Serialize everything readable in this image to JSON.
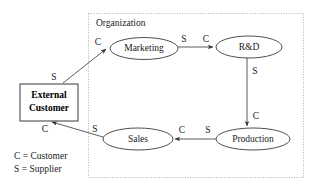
{
  "diagram": {
    "container": {
      "title": "Organization"
    },
    "nodes": [
      {
        "id": "external_customer",
        "label_line1": "External",
        "label_line2": "Customer",
        "shape": "rectangle"
      },
      {
        "id": "marketing",
        "label": "Marketing",
        "shape": "ellipse"
      },
      {
        "id": "rnd",
        "label": "R&D",
        "shape": "ellipse"
      },
      {
        "id": "production",
        "label": "Production",
        "shape": "ellipse"
      },
      {
        "id": "sales",
        "label": "Sales",
        "shape": "ellipse"
      }
    ],
    "edges": [
      {
        "id": "ec-to-marketing",
        "from": "external_customer",
        "to": "marketing",
        "source_label": "S",
        "target_label": "C"
      },
      {
        "id": "marketing-to-rnd",
        "from": "marketing",
        "to": "rnd",
        "source_label": "S",
        "target_label": "C"
      },
      {
        "id": "rnd-to-production",
        "from": "rnd",
        "to": "production",
        "source_label": "S",
        "target_label": "C"
      },
      {
        "id": "production-to-sales",
        "from": "production",
        "to": "sales",
        "source_label": "S",
        "target_label": "C"
      },
      {
        "id": "sales-to-ec",
        "from": "sales",
        "to": "external_customer",
        "source_label": "S",
        "target_label": "C"
      }
    ],
    "legend": {
      "line1": "C = Customer",
      "line2": "S = Supplier"
    }
  },
  "colors": {
    "background": "#ffffff",
    "stroke": "#4a4a4a",
    "container_stroke": "#9a9a9a",
    "text": "#1a1a1a"
  }
}
